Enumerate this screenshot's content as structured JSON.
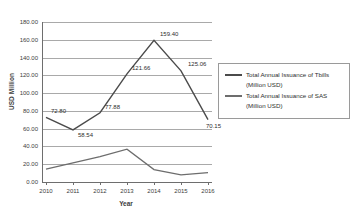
{
  "chart_data": {
    "type": "line",
    "title": "",
    "xlabel": "Year",
    "ylabel": "USD Million",
    "categories": [
      "2010",
      "2011",
      "2012",
      "2013",
      "2014",
      "2015",
      "2016"
    ],
    "ylim": [
      0,
      180
    ],
    "ytick_labels": [
      "180.00",
      "160.00",
      "140.00",
      "120.00",
      "100.00",
      "80.00",
      "60.00",
      "40.00",
      "20.00",
      "0.00"
    ],
    "ytick_values": [
      180,
      160,
      140,
      120,
      100,
      80,
      60,
      40,
      20,
      0
    ],
    "grid": true,
    "legend_position": "right",
    "series": [
      {
        "name": "Total Annual Issuance of Tbills (Million USD)",
        "name_line1": "Total Annual Issuance of Tbills",
        "name_line2": "(Million USD)",
        "color": "#4b4b4b",
        "values": [
          72.8,
          58.54,
          77.88,
          121.66,
          159.4,
          125.06,
          70.15
        ],
        "data_labels": [
          "72.80",
          "58.54",
          "77.88",
          "121.66",
          "159.40",
          "125.06",
          "70.15"
        ]
      },
      {
        "name": "Total Annual Issuance of SAS (Million USD)",
        "name_line1": "Total Annual Issuance of SAS",
        "name_line2": "(Million USD)",
        "color": "#6d6d6d",
        "values": [
          14.5,
          21.5,
          28.5,
          37.0,
          14.0,
          8.0,
          10.5
        ],
        "data_labels": []
      }
    ]
  }
}
